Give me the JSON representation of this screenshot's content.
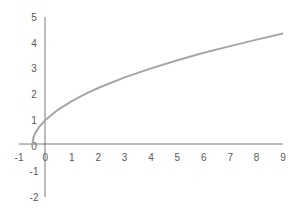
{
  "chart_data": {
    "type": "line",
    "title": "",
    "xlabel": "",
    "ylabel": "",
    "function_hint": "y = sqrt(2x + 1)",
    "xlim": [
      -1,
      9
    ],
    "ylim": [
      -2,
      5
    ],
    "grid": false,
    "legend": null,
    "x_ticks": [
      "-1",
      "0",
      "1",
      "2",
      "3",
      "4",
      "5",
      "6",
      "7",
      "8",
      "9"
    ],
    "y_ticks": [
      "5",
      "4",
      "3",
      "2",
      "1",
      "0",
      "-1",
      "-2"
    ],
    "series": [
      {
        "name": "curve",
        "color": "#a6a6a6",
        "x": [
          -0.5,
          -0.45,
          -0.4,
          -0.3,
          -0.2,
          0,
          0.5,
          1,
          1.5,
          2,
          3,
          4,
          5,
          6,
          7,
          8,
          9
        ],
        "y": [
          0,
          0.32,
          0.45,
          0.63,
          0.77,
          1,
          1.41,
          1.73,
          2,
          2.24,
          2.65,
          3,
          3.32,
          3.61,
          3.87,
          4.12,
          4.36
        ]
      }
    ]
  },
  "colors": {
    "axis": "#595959",
    "curve": "#a6a6a6",
    "label": "#595959",
    "background": "#ffffff"
  }
}
